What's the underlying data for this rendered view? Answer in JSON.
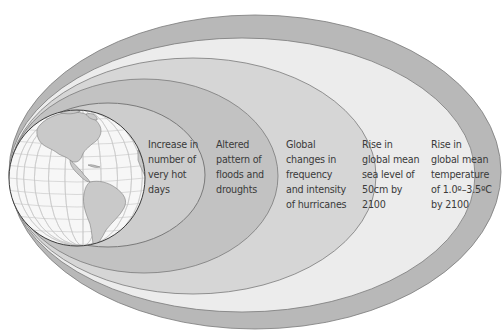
{
  "diagram": {
    "type": "nested-ellipses",
    "center_image": "globe-americas",
    "rings": [
      {
        "id": "hot-days",
        "lines": [
          "Increase in",
          "number of",
          "very hot",
          "days"
        ],
        "fill": "#cdcdcd"
      },
      {
        "id": "floods-droughts",
        "lines": [
          "Altered",
          "pattern of",
          "floods and",
          "droughts"
        ],
        "fill": "#c2c2c2"
      },
      {
        "id": "hurricanes",
        "lines": [
          "Global",
          "changes in",
          "frequency",
          "and intensity",
          "of hurricanes"
        ],
        "fill": "#d6d6d6"
      },
      {
        "id": "sea-level",
        "lines": [
          "Rise in",
          "global mean",
          "sea level of",
          "50cm by",
          "2100"
        ],
        "fill": "#ececec"
      },
      {
        "id": "temperature",
        "lines": [
          "Rise in",
          "global mean",
          "temperature",
          "of 1.0º–3.5ºC",
          "by 2100"
        ],
        "fill": "#b8b8b8"
      }
    ],
    "colors": {
      "outline": "#7a7a7a",
      "globe_ocean": "#f7f7f7",
      "globe_land": "#c9c9c9",
      "globe_grid": "#c4c4c4",
      "text": "#3a3a3a"
    }
  }
}
